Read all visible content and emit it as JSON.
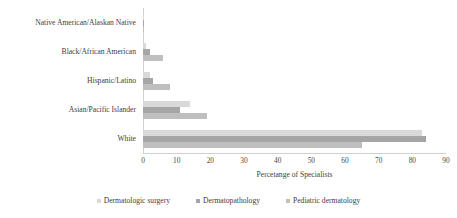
{
  "chart_data": {
    "type": "bar",
    "orientation": "horizontal",
    "title": "",
    "xlabel": "Percetange of Specialists",
    "ylabel": "",
    "xlim": [
      0,
      90
    ],
    "xticks": [
      0,
      10,
      20,
      30,
      40,
      50,
      60,
      70,
      80,
      90
    ],
    "grid": false,
    "legend_position": "bottom",
    "categories": [
      "Native American/Alaskan Native",
      "Black/African American",
      "Hispanic/Latino",
      "Asian/Pacific Islander",
      "White"
    ],
    "series": [
      {
        "name": "Dermatologic surgery",
        "color": "#d9d9d9",
        "values": [
          0.3,
          1.0,
          2.0,
          14.0,
          83.0
        ]
      },
      {
        "name": "Dermatopathology",
        "color": "#a6a6a6",
        "values": [
          0.3,
          2.0,
          3.0,
          11.0,
          84.0
        ]
      },
      {
        "name": "Pediatric dermatology",
        "color": "#bfbfbf",
        "values": [
          0.4,
          6.0,
          8.0,
          19.0,
          65.0
        ]
      }
    ]
  }
}
